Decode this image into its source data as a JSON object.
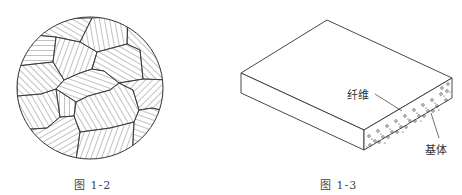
{
  "figures": [
    {
      "id": "fig-1-2",
      "caption": "图 1-2",
      "description": "Polycrystalline grain structure in a circular cross-section, each grain hatched with differently oriented parallel lines"
    },
    {
      "id": "fig-1-3",
      "caption": "图 1-3",
      "description": "Isometric view of a composite laminate slab with embedded fibers in a matrix",
      "labels": {
        "fiber": "纤维",
        "matrix": "基体"
      }
    }
  ],
  "colors": {
    "line": "#333333",
    "background": "#ffffff"
  }
}
